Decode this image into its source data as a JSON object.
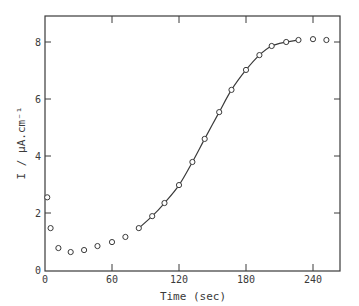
{
  "chart_data": {
    "type": "scatter",
    "title": "",
    "xlabel": "Time (sec)",
    "ylabel": "I / μA.cm⁻¹",
    "xlim": [
      0,
      270
    ],
    "ylim": [
      0,
      8.8
    ],
    "xticks": [
      0,
      60,
      120,
      180,
      240
    ],
    "yticks": [
      0,
      2,
      4,
      6,
      8
    ],
    "grid": false,
    "legend": null,
    "series": [
      {
        "name": "measured",
        "style": "open-circles",
        "x": [
          2,
          5,
          12,
          23,
          35,
          47,
          60,
          72,
          84,
          96,
          107,
          120,
          132,
          143,
          156,
          167,
          180,
          192,
          203,
          216,
          227,
          240,
          252
        ],
        "y": [
          2.55,
          1.47,
          0.77,
          0.63,
          0.7,
          0.84,
          0.98,
          1.16,
          1.47,
          1.89,
          2.35,
          2.98,
          3.79,
          4.6,
          5.54,
          6.32,
          7.02,
          7.54,
          7.86,
          8.0,
          8.07,
          8.1,
          8.07
        ]
      },
      {
        "name": "fit",
        "style": "solid-line",
        "x": [
          84,
          96,
          107,
          120,
          132,
          143,
          156,
          167,
          180,
          192,
          203,
          216,
          227
        ],
        "y": [
          1.47,
          1.89,
          2.35,
          2.98,
          3.79,
          4.6,
          5.54,
          6.32,
          7.02,
          7.54,
          7.86,
          8.0,
          8.07
        ]
      }
    ]
  },
  "colors": {
    "ink": "#3a3a3a",
    "background": "#ffffff"
  }
}
